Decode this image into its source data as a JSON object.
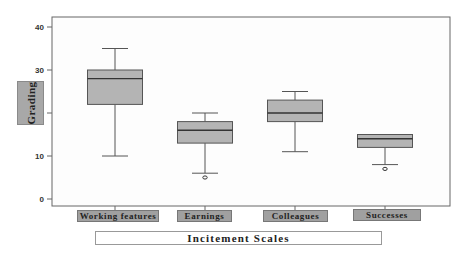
{
  "chart_data": {
    "type": "box",
    "title": "",
    "xlabel": "Incitement Scales",
    "ylabel": "Grading",
    "ylim": [
      -2,
      42
    ],
    "yticks": [
      0,
      10,
      20,
      30,
      40
    ],
    "grid": false,
    "legend": null,
    "categories": [
      "Working features",
      "Earnings",
      "Colleagues",
      "Successes"
    ],
    "boxes": [
      {
        "name": "Working features",
        "whisker_low": 10,
        "q1": 22,
        "median": 28,
        "q3": 30,
        "whisker_high": 35,
        "outliers": []
      },
      {
        "name": "Earnings",
        "whisker_low": 6,
        "q1": 13,
        "median": 16,
        "q3": 18,
        "whisker_high": 20,
        "outliers": [
          5
        ]
      },
      {
        "name": "Colleagues",
        "whisker_low": 11,
        "q1": 18,
        "median": 20,
        "q3": 23,
        "whisker_high": 25,
        "outliers": []
      },
      {
        "name": "Successes",
        "whisker_low": 8,
        "q1": 12,
        "median": 14,
        "q3": 15,
        "whisker_high": 15,
        "outliers": [
          7
        ]
      }
    ]
  },
  "colors": {
    "box_fill": "#b4b4b4",
    "box_stroke": "#555555",
    "frame": "#666666",
    "label_fill": "#a0a0a0"
  }
}
